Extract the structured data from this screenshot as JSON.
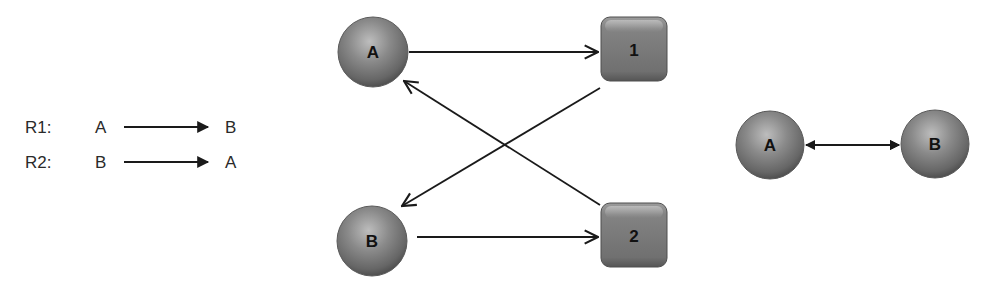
{
  "colors": {
    "node_fill": "#7d7d7d",
    "node_highlight": "#b4b4b4",
    "node_shadow": "#4a4a4a",
    "edge": "#1a1a1a",
    "text": "#2a2a2a"
  },
  "reactions": [
    {
      "label": "R1:",
      "reactant": "A",
      "product": "B"
    },
    {
      "label": "R2:",
      "reactant": "B",
      "product": "A"
    }
  ],
  "bipartite_graph": {
    "species_nodes": [
      {
        "id": "A",
        "label": "A"
      },
      {
        "id": "B",
        "label": "B"
      }
    ],
    "reaction_nodes": [
      {
        "id": "1",
        "label": "1"
      },
      {
        "id": "2",
        "label": "2"
      }
    ],
    "edges": [
      {
        "from": "A",
        "to": "1"
      },
      {
        "from": "1",
        "to": "B"
      },
      {
        "from": "B",
        "to": "2"
      },
      {
        "from": "2",
        "to": "A"
      }
    ]
  },
  "simple_graph": {
    "nodes": [
      {
        "id": "A",
        "label": "A"
      },
      {
        "id": "B",
        "label": "B"
      }
    ],
    "edges": [
      {
        "between": [
          "A",
          "B"
        ],
        "type": "bidirectional"
      }
    ]
  }
}
